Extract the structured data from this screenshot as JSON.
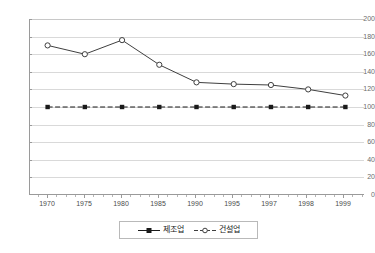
{
  "chart_data": {
    "type": "line",
    "title": "",
    "subtitle": "",
    "xlabel": "",
    "ylabel": "",
    "categories": [
      "1970",
      "1975",
      "1980",
      "1985",
      "1990",
      "1995",
      "1997",
      "1998",
      "1999"
    ],
    "ylim": [
      0,
      200
    ],
    "ytick_step": 20,
    "yticks": [
      "200",
      "180",
      "160",
      "140",
      "120",
      "100",
      "80",
      "60",
      "40",
      "20",
      "0"
    ],
    "grid": true,
    "grid_axis": "y",
    "legend_position": "bottom-center",
    "series": [
      {
        "name": "제조업",
        "values": [
          100,
          100,
          100,
          100,
          100,
          100,
          100,
          100,
          100
        ],
        "marker": "filled-square",
        "line_style": "dashed",
        "color": "#1a1a1a"
      },
      {
        "name": "건설업",
        "values": [
          170,
          160,
          176,
          148,
          128,
          126,
          125,
          120,
          113
        ],
        "marker": "open-circle",
        "line_style": "solid",
        "color": "#3f3f3f"
      }
    ]
  },
  "legend": {
    "items": [
      {
        "label": "제조업",
        "marker": "filled-square",
        "line_style": "solid"
      },
      {
        "label": "건설업",
        "marker": "open-circle",
        "line_style": "dashed"
      }
    ]
  },
  "axes": {
    "y_labels": [
      "200",
      "180",
      "160",
      "140",
      "120",
      "100",
      "80",
      "60",
      "40",
      "20",
      "0"
    ],
    "x_labels": [
      "1970",
      "1975",
      "1980",
      "1985",
      "1990",
      "1995",
      "1997",
      "1998",
      "1999"
    ]
  },
  "colors": {
    "axis": "#9a9a9a",
    "grid": "#d9d9d9",
    "series_manufacturing": "#1a1a1a",
    "series_construction": "#3f3f3f",
    "tick_text": "#6b6b6b",
    "background": "#ffffff"
  }
}
